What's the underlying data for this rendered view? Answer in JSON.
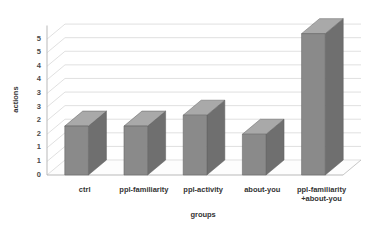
{
  "chart_data": {
    "type": "bar",
    "title": "",
    "subtitle": "",
    "xlabel": "groups",
    "ylabel": "actions",
    "categories": [
      "ctrl",
      "ppl-familiarity",
      "ppl-activity",
      "about-you",
      "ppl-familiarity\n+about-you"
    ],
    "values": [
      1.8,
      1.8,
      2.2,
      1.5,
      5.2
    ],
    "series": [
      {
        "name": "actions",
        "values": [
          1.8,
          1.8,
          2.2,
          1.5,
          5.2
        ]
      }
    ],
    "ylim": [
      0,
      5.5
    ],
    "ytick_values": [
      0,
      0.5,
      1,
      1.5,
      2,
      2.5,
      3,
      3.5,
      4,
      4.5,
      5
    ],
    "ytick_labels": [
      "0",
      "1",
      "1",
      "2",
      "2",
      "3",
      "3",
      "4",
      "4",
      "5",
      "5"
    ],
    "grid": true,
    "legend": false,
    "legend_position": "none",
    "style": "3d-column",
    "colors": {
      "bar_face": "#8a8a8a",
      "bar_top": "#a9a9a9",
      "bar_side": "#6f6f6f",
      "bar_outline": "#5e5e5e",
      "gridline": "#d2d2d2",
      "axis_line": "#b9b9b9",
      "floor": "#fdfdfd",
      "background": "#ffffff",
      "text": "#333333"
    }
  }
}
